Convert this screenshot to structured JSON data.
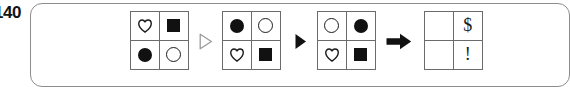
{
  "item": {
    "number": "140"
  },
  "panel": {
    "border_color": "#8d8d8d"
  },
  "puzzle": {
    "type": "visual-analogy",
    "grid_line_color": "#6b6b6b",
    "shape_color": "#111111",
    "grids": [
      {
        "id": "grid-1",
        "name": "source-grid-a",
        "cells": [
          {
            "position": "top-left",
            "glyph": "heart-outline",
            "label": "heart"
          },
          {
            "position": "top-right",
            "glyph": "square-filled",
            "label": "filled square"
          },
          {
            "position": "bottom-left",
            "glyph": "circle-filled",
            "label": "filled circle"
          },
          {
            "position": "bottom-right",
            "glyph": "circle-hollow",
            "label": "hollow circle"
          }
        ]
      },
      {
        "id": "grid-2",
        "name": "result-grid-b",
        "cells": [
          {
            "position": "top-left",
            "glyph": "circle-filled",
            "label": "filled circle"
          },
          {
            "position": "top-right",
            "glyph": "circle-hollow",
            "label": "hollow circle"
          },
          {
            "position": "bottom-left",
            "glyph": "heart-outline",
            "label": "heart"
          },
          {
            "position": "bottom-right",
            "glyph": "square-filled",
            "label": "filled square"
          }
        ]
      },
      {
        "id": "grid-3",
        "name": "source-grid-c",
        "cells": [
          {
            "position": "top-left",
            "glyph": "circle-hollow",
            "label": "hollow circle"
          },
          {
            "position": "top-right",
            "glyph": "circle-filled",
            "label": "filled circle"
          },
          {
            "position": "bottom-left",
            "glyph": "heart-outline",
            "label": "heart"
          },
          {
            "position": "bottom-right",
            "glyph": "square-filled",
            "label": "filled square"
          }
        ]
      },
      {
        "id": "grid-4",
        "name": "answer-grid-d",
        "cells": [
          {
            "position": "top-left",
            "glyph": "empty",
            "label": ""
          },
          {
            "position": "top-right",
            "glyph": "char",
            "label": "$"
          },
          {
            "position": "bottom-left",
            "glyph": "empty",
            "label": ""
          },
          {
            "position": "bottom-right",
            "glyph": "char",
            "label": "!"
          }
        ]
      }
    ],
    "separators": [
      {
        "id": "sep-1",
        "name": "hollow-triangle-icon",
        "glyph": "triangle-outline-right"
      },
      {
        "id": "sep-2",
        "name": "solid-triangle-icon",
        "glyph": "triangle-filled-right"
      },
      {
        "id": "sep-3",
        "name": "right-arrow-icon",
        "glyph": "arrow-right-solid"
      }
    ]
  }
}
